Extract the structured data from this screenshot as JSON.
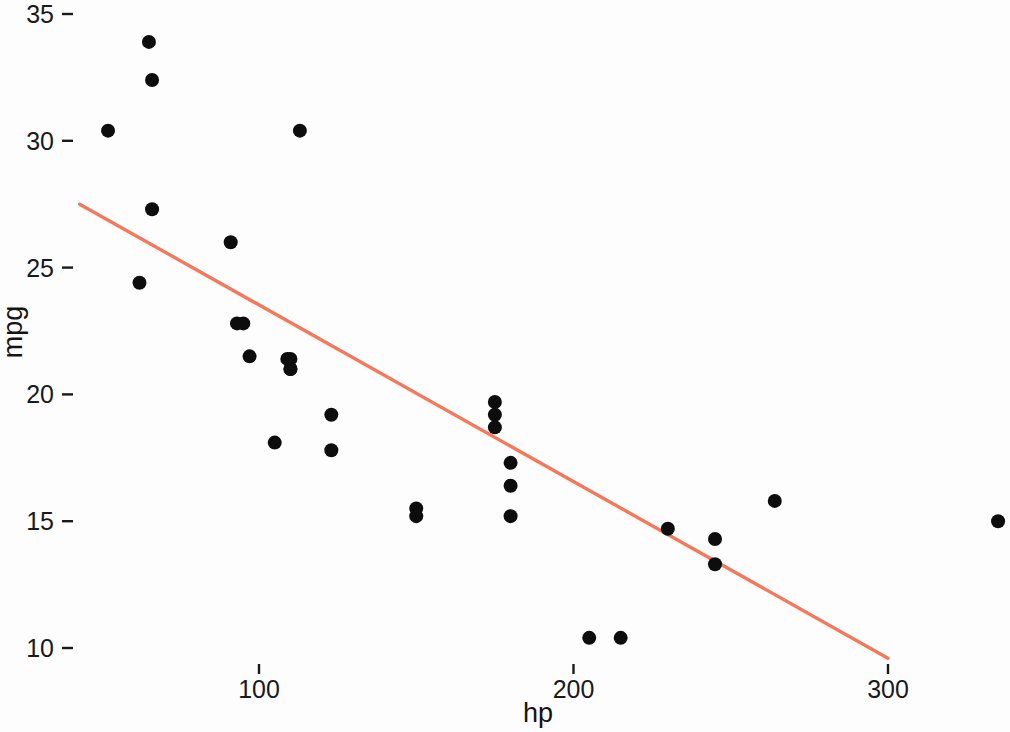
{
  "chart_data": {
    "type": "scatter",
    "title": "",
    "subtitle": "",
    "xlabel": "hp",
    "ylabel": "mpg",
    "xlim": [
      40,
      345
    ],
    "ylim": [
      9.2,
      35.4
    ],
    "x_ticks": [
      100,
      200,
      300
    ],
    "y_ticks": [
      10,
      15,
      20,
      25,
      30,
      35
    ],
    "x_tick_labels": [
      "100",
      "200",
      "300"
    ],
    "y_tick_labels": [
      "10",
      "15",
      "20",
      "25",
      "30",
      "35"
    ],
    "grid": false,
    "legend": null,
    "legend_position": "none",
    "point_color": "#0d0d0d",
    "point_radius_px": 7,
    "series": [
      {
        "name": "mtcars",
        "type": "scatter",
        "x": [
          110,
          110,
          93,
          110,
          175,
          105,
          245,
          62,
          95,
          123,
          123,
          180,
          180,
          180,
          205,
          215,
          230,
          66,
          52,
          65,
          97,
          150,
          150,
          245,
          175,
          66,
          91,
          113,
          264,
          175,
          335,
          109
        ],
        "y": [
          21.0,
          21.0,
          22.8,
          21.4,
          18.7,
          18.1,
          14.3,
          24.4,
          22.8,
          19.2,
          17.8,
          16.4,
          17.3,
          15.2,
          10.4,
          10.4,
          14.7,
          32.4,
          30.4,
          33.9,
          21.5,
          15.5,
          15.2,
          13.3,
          19.2,
          27.3,
          26.0,
          30.4,
          15.8,
          19.7,
          15.0,
          21.4
        ]
      }
    ],
    "trend_line": {
      "name": "linear regression",
      "color": "#f4785c",
      "width_px": 3.4,
      "x_start": 43,
      "y_start": 27.5,
      "x_end": 300,
      "y_end": 9.6
    }
  },
  "axes": {
    "x_axis_title": "hp",
    "y_axis_title": "mpg"
  }
}
